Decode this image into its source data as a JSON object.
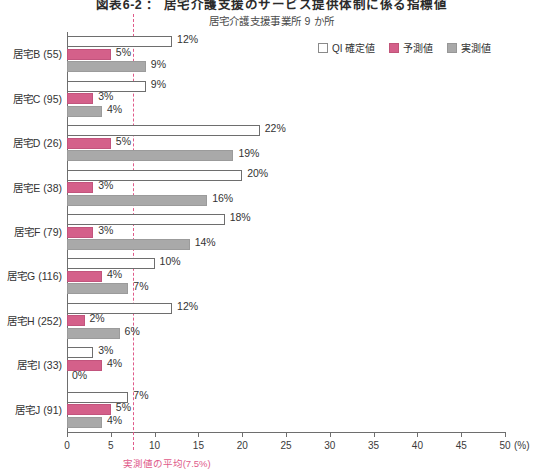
{
  "titles": {
    "main": "図表6-2 ： 居宅介護支援のサービス提供体制に係る指標値",
    "sub": "居宅介護支援事業所 9 か所"
  },
  "legend": {
    "items": [
      {
        "label": "QI 確定値",
        "swatch": "qi",
        "color": "#ffffff"
      },
      {
        "label": "予測値",
        "swatch": "yosoku",
        "color": "#d4608a"
      },
      {
        "label": "実測値",
        "swatch": "jissoku",
        "color": "#a9a9a9"
      }
    ]
  },
  "axis": {
    "unit": "(%)",
    "ticks": [
      "0",
      "5",
      "10",
      "15",
      "20",
      "25",
      "30",
      "35",
      "40",
      "45",
      "50"
    ]
  },
  "average": {
    "caption": "実測値の平均(7.5%)",
    "value": 7.5,
    "color": "#e05a8a"
  },
  "chart_data": {
    "type": "bar",
    "orientation": "horizontal",
    "title": "図表6-2 ： 居宅介護支援のサービス提供体制に係る指標値",
    "subtitle": "居宅介護支援事業所 9 か所",
    "xlabel": "(%)",
    "ylabel": "",
    "xlim": [
      0,
      50
    ],
    "xticks": [
      0,
      5,
      10,
      15,
      20,
      25,
      30,
      35,
      40,
      45,
      50
    ],
    "grid": false,
    "legend_position": "top-right",
    "categories": [
      "居宅B",
      "居宅C",
      "居宅D",
      "居宅E",
      "居宅F",
      "居宅G",
      "居宅H",
      "居宅I",
      "居宅J"
    ],
    "category_counts": [
      "(55)",
      "(95)",
      "(26)",
      "(38)",
      "(79)",
      "(116)",
      "(252)",
      "(33)",
      "(91)"
    ],
    "series": [
      {
        "name": "QI 確定値",
        "color": "#ffffff",
        "values": [
          12,
          9,
          22,
          20,
          18,
          10,
          12,
          3,
          7
        ],
        "labels": [
          "12%",
          "9%",
          "22%",
          "20%",
          "18%",
          "10%",
          "12%",
          "3%",
          "7%"
        ]
      },
      {
        "name": "予測値",
        "color": "#d4608a",
        "values": [
          5,
          3,
          5,
          3,
          3,
          4,
          2,
          4,
          5
        ],
        "labels": [
          "5%",
          "3%",
          "5%",
          "3%",
          "3%",
          "4%",
          "2%",
          "4%",
          "5%"
        ]
      },
      {
        "name": "実測値",
        "color": "#a9a9a9",
        "values": [
          9,
          4,
          19,
          16,
          14,
          7,
          6,
          0,
          4
        ],
        "labels": [
          "9%",
          "4%",
          "19%",
          "16%",
          "14%",
          "7%",
          "6%",
          "0%",
          "4%"
        ]
      }
    ],
    "annotations": [
      {
        "type": "vline",
        "value": 7.5,
        "label": "実測値の平均(7.5%)",
        "color": "#e05a8a",
        "style": "dashed"
      }
    ]
  }
}
